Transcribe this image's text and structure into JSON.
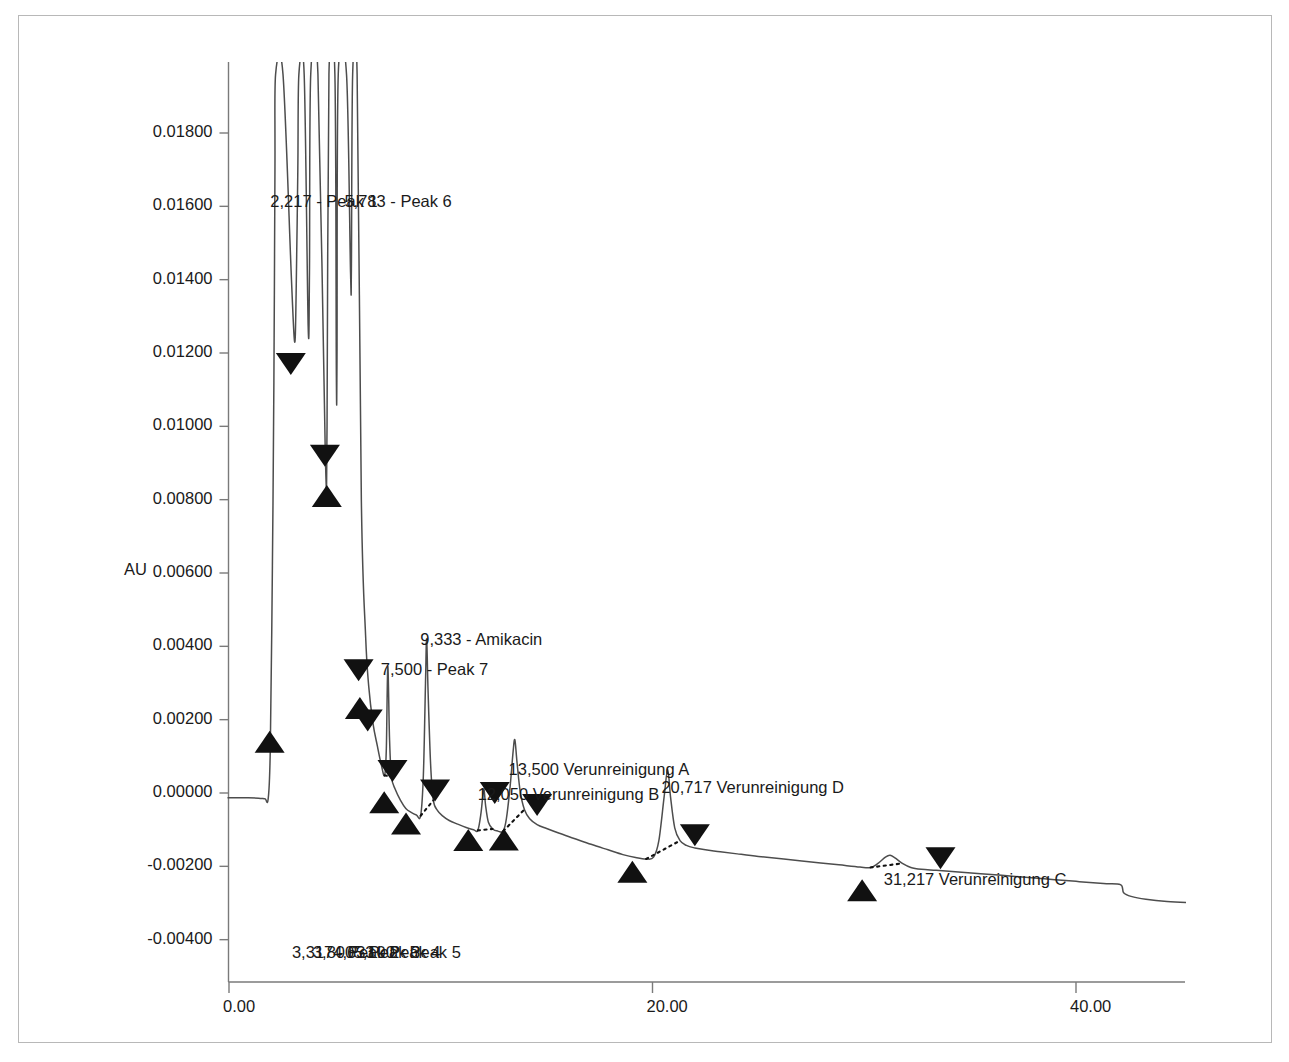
{
  "chart_data": {
    "type": "line",
    "title": "",
    "xlabel": "",
    "ylabel": "AU",
    "xlim": [
      -1.4,
      48.5
    ],
    "ylim": [
      -0.0048,
      0.0196
    ],
    "xticks": [
      "0.00",
      "20.00",
      "40.00"
    ],
    "xtick_values": [
      0,
      20,
      40
    ],
    "yticks": [
      "0.01800",
      "0.01600",
      "0.01400",
      "0.01200",
      "0.01000",
      "0.00800",
      "0.00600",
      "0.00400",
      "0.00200",
      "0.00000",
      "-0.00200",
      "-0.00400"
    ],
    "ytick_values": [
      0.018,
      0.016,
      0.014,
      0.012,
      0.01,
      0.008,
      0.006,
      0.004,
      0.002,
      0.0,
      -0.002,
      -0.004
    ],
    "grid": false,
    "legend": "none",
    "line_color": "#4d4d4d",
    "marker_color": "#111111",
    "baseline_style": "dotted",
    "series": [
      {
        "name": "detector-trace",
        "points": [
          [
            -1.3,
            -0.00012
          ],
          [
            -0.6,
            -0.00012
          ],
          [
            0.2,
            -0.00013
          ],
          [
            0.9,
            -0.00013
          ],
          [
            1.4,
            -0.00014
          ],
          [
            1.7,
            -0.00016
          ],
          [
            1.85,
            -0.00016
          ],
          [
            1.95,
            0.0012
          ],
          [
            2.05,
            0.0062
          ],
          [
            2.12,
            0.0112
          ],
          [
            2.17,
            0.017
          ],
          [
            2.2,
            0.0196
          ],
          [
            2.55,
            0.0196
          ],
          [
            2.95,
            0.014
          ],
          [
            3.1,
            0.0123
          ],
          [
            3.17,
            0.0136
          ],
          [
            3.25,
            0.017
          ],
          [
            3.3,
            0.0196
          ],
          [
            3.55,
            0.0196
          ],
          [
            3.74,
            0.0127
          ],
          [
            3.8,
            0.0142
          ],
          [
            3.86,
            0.0196
          ],
          [
            4.2,
            0.0196
          ],
          [
            4.55,
            0.0092
          ],
          [
            4.63,
            0.01
          ],
          [
            4.72,
            0.0196
          ],
          [
            5.0,
            0.0196
          ],
          [
            5.07,
            0.0114
          ],
          [
            5.1,
            0.0118
          ],
          [
            5.16,
            0.0196
          ],
          [
            5.55,
            0.0196
          ],
          [
            5.74,
            0.0142
          ],
          [
            5.78,
            0.0143
          ],
          [
            5.84,
            0.0196
          ],
          [
            6.05,
            0.0196
          ],
          [
            6.25,
            0.008
          ],
          [
            6.45,
            0.0043
          ],
          [
            6.6,
            0.0029
          ],
          [
            6.8,
            0.0019
          ],
          [
            7.0,
            0.0013
          ],
          [
            7.2,
            0.00075
          ],
          [
            7.35,
            0.00048
          ],
          [
            7.43,
            0.0012
          ],
          [
            7.5,
            0.00345
          ],
          [
            7.58,
            0.0015
          ],
          [
            7.67,
            0.00045
          ],
          [
            7.85,
            0.0001
          ],
          [
            8.1,
            -0.0002
          ],
          [
            8.35,
            -0.00042
          ],
          [
            8.6,
            -0.00053
          ],
          [
            8.85,
            -0.0006
          ],
          [
            9.05,
            -0.00062
          ],
          [
            9.18,
            0.0005
          ],
          [
            9.28,
            0.003
          ],
          [
            9.333,
            0.0042
          ],
          [
            9.4,
            0.0028
          ],
          [
            9.52,
            0.0008
          ],
          [
            9.65,
            -0.0002
          ],
          [
            9.85,
            -0.00048
          ],
          [
            10.1,
            -0.00063
          ],
          [
            10.4,
            -0.00075
          ],
          [
            10.8,
            -0.00085
          ],
          [
            11.2,
            -0.00094
          ],
          [
            11.55,
            -0.001
          ],
          [
            11.75,
            -0.00102
          ],
          [
            11.9,
            -0.00055
          ],
          [
            12.0,
            0.0
          ],
          [
            12.05,
            8e-05
          ],
          [
            12.12,
            -0.00035
          ],
          [
            12.25,
            -0.0008
          ],
          [
            12.45,
            -0.00098
          ],
          [
            12.7,
            -0.00104
          ],
          [
            12.95,
            -0.00104
          ],
          [
            13.1,
            -0.0007
          ],
          [
            13.28,
            0.0002
          ],
          [
            13.42,
            0.00115
          ],
          [
            13.5,
            0.00145
          ],
          [
            13.6,
            0.00085
          ],
          [
            13.75,
            5e-05
          ],
          [
            13.95,
            -0.00045
          ],
          [
            14.2,
            -0.0007
          ],
          [
            14.55,
            -0.00086
          ],
          [
            15.0,
            -0.00097
          ],
          [
            15.6,
            -0.0011
          ],
          [
            16.3,
            -0.00124
          ],
          [
            17.1,
            -0.0014
          ],
          [
            17.9,
            -0.00155
          ],
          [
            18.6,
            -0.00168
          ],
          [
            19.2,
            -0.00176
          ],
          [
            19.7,
            -0.0018
          ],
          [
            20.05,
            -0.00175
          ],
          [
            20.3,
            -0.0013
          ],
          [
            20.55,
            -0.0001
          ],
          [
            20.717,
            0.00065
          ],
          [
            20.85,
            -0.0001
          ],
          [
            21.05,
            -0.00095
          ],
          [
            21.3,
            -0.0013
          ],
          [
            21.6,
            -0.00143
          ],
          [
            22.0,
            -0.0015
          ],
          [
            22.5,
            -0.00155
          ],
          [
            23.2,
            -0.0016
          ],
          [
            24.0,
            -0.00166
          ],
          [
            25.0,
            -0.00173
          ],
          [
            26.2,
            -0.0018
          ],
          [
            27.5,
            -0.00188
          ],
          [
            28.8,
            -0.00196
          ],
          [
            29.8,
            -0.00202
          ],
          [
            30.3,
            -0.00203
          ],
          [
            30.65,
            -0.00192
          ],
          [
            31.0,
            -0.00175
          ],
          [
            31.217,
            -0.0017
          ],
          [
            31.45,
            -0.00177
          ],
          [
            31.8,
            -0.00192
          ],
          [
            32.2,
            -0.00203
          ],
          [
            32.7,
            -0.00208
          ],
          [
            33.4,
            -0.00211
          ],
          [
            34.3,
            -0.00215
          ],
          [
            35.5,
            -0.0022
          ],
          [
            37.0,
            -0.00227
          ],
          [
            38.5,
            -0.00234
          ],
          [
            40.0,
            -0.00241
          ],
          [
            41.3,
            -0.00247
          ],
          [
            42.1,
            -0.0025
          ],
          [
            42.25,
            -0.00272
          ],
          [
            42.6,
            -0.00282
          ],
          [
            43.3,
            -0.0029
          ],
          [
            44.3,
            -0.00296
          ],
          [
            45.5,
            -0.00299
          ],
          [
            46.6,
            -0.003
          ]
        ]
      }
    ],
    "baselines": [
      {
        "name": "bl-peak7",
        "points": [
          [
            7.35,
            0.00048
          ],
          [
            7.67,
            0.00045
          ]
        ]
      },
      {
        "name": "bl-amikacin",
        "points": [
          [
            9.05,
            -0.00062
          ],
          [
            9.65,
            -0.0002
          ]
        ]
      },
      {
        "name": "bl-verb",
        "points": [
          [
            11.75,
            -0.00102
          ],
          [
            12.45,
            -0.00098
          ]
        ]
      },
      {
        "name": "bl-vera",
        "points": [
          [
            12.95,
            -0.00104
          ],
          [
            13.95,
            -0.00045
          ]
        ]
      },
      {
        "name": "bl-verd",
        "points": [
          [
            19.7,
            -0.0018
          ],
          [
            21.3,
            -0.0013
          ]
        ]
      },
      {
        "name": "bl-verc",
        "points": [
          [
            30.3,
            -0.00203
          ],
          [
            31.8,
            -0.00192
          ]
        ]
      }
    ],
    "markers": [
      {
        "name": "start-peak1",
        "dir": "up",
        "x": 1.92,
        "y": 0.0017
      },
      {
        "name": "end-peak1",
        "dir": "down",
        "x": 2.92,
        "y": 0.0114
      },
      {
        "name": "end-peak3",
        "dir": "down",
        "x": 4.53,
        "y": 0.0089
      },
      {
        "name": "start-peak4",
        "dir": "up",
        "x": 4.62,
        "y": 0.0084
      },
      {
        "name": "end-peak4",
        "dir": "down",
        "x": 6.12,
        "y": 0.00305
      },
      {
        "name": "start-peak5",
        "dir": "up",
        "x": 6.18,
        "y": 0.00262
      },
      {
        "name": "end-peak6",
        "dir": "down",
        "x": 6.55,
        "y": 0.00168
      },
      {
        "name": "start-peak7",
        "dir": "up",
        "x": 7.33,
        "y": 5e-05
      },
      {
        "name": "end-peak7",
        "dir": "down",
        "x": 7.72,
        "y": 0.0003
      },
      {
        "name": "start-amikacin",
        "dir": "up",
        "x": 8.36,
        "y": -0.00053
      },
      {
        "name": "end-amikacin",
        "dir": "down",
        "x": 9.73,
        "y": -0.00023
      },
      {
        "name": "start-verb",
        "dir": "up",
        "x": 11.3,
        "y": -0.00098
      },
      {
        "name": "end-verb",
        "dir": "down",
        "x": 12.55,
        "y": -0.0003
      },
      {
        "name": "start-vera",
        "dir": "up",
        "x": 12.98,
        "y": -0.00097
      },
      {
        "name": "end-vera",
        "dir": "down",
        "x": 14.55,
        "y": -0.00063
      },
      {
        "name": "start-verd",
        "dir": "up",
        "x": 19.05,
        "y": -0.00185
      },
      {
        "name": "end-verd",
        "dir": "down",
        "x": 22.0,
        "y": -0.00145
      },
      {
        "name": "start-verc",
        "dir": "up",
        "x": 29.9,
        "y": -0.00235
      },
      {
        "name": "end-verc",
        "dir": "down",
        "x": 33.6,
        "y": -0.00208
      }
    ],
    "annotations": [
      {
        "name": "label-peak1",
        "text": "2,217 - Peak 1",
        "x": 2.33,
        "y_px": 192,
        "rotation": -90
      },
      {
        "name": "label-peak6",
        "text": "5,783 - Peak 6",
        "x": 5.83,
        "y_px": 192,
        "rotation": -90
      },
      {
        "name": "label-peak2",
        "text": "3,317 - Peak 2",
        "x": 3.35,
        "y_px": 943,
        "rotation": -90
      },
      {
        "name": "label-peak3",
        "text": "3,800 - Peak 3",
        "x": 4.34,
        "y_px": 943,
        "rotation": -90
      },
      {
        "name": "label-peak4",
        "text": "4,633 - Peak 4",
        "x": 5.3,
        "y_px": 943,
        "rotation": -90
      },
      {
        "name": "label-peak5",
        "text": "5,100 - Peak 5",
        "x": 6.26,
        "y_px": 943,
        "rotation": -90
      },
      {
        "name": "label-peak7",
        "text": "7,500 - Peak 7",
        "x": 7.55,
        "y_px": 660,
        "rotation": -90
      },
      {
        "name": "label-amikacin",
        "text": "9,333 - Amikacin",
        "x": 9.41,
        "y_px": 630,
        "rotation": -90
      },
      {
        "name": "label-verb",
        "text": "12,050 Verunreinigung B",
        "x": 12.12,
        "y_px": 785,
        "rotation": -90
      },
      {
        "name": "label-vera",
        "text": "13,500 Verunreinigung A",
        "x": 13.58,
        "y_px": 760,
        "rotation": -90
      },
      {
        "name": "label-verd",
        "text": "20,717 Verunreinigung D",
        "x": 20.8,
        "y_px": 778,
        "rotation": -90
      },
      {
        "name": "label-verc",
        "text": "31,217 Verunreinigung C",
        "x": 31.3,
        "y_px": 870,
        "rotation": -90
      }
    ]
  }
}
